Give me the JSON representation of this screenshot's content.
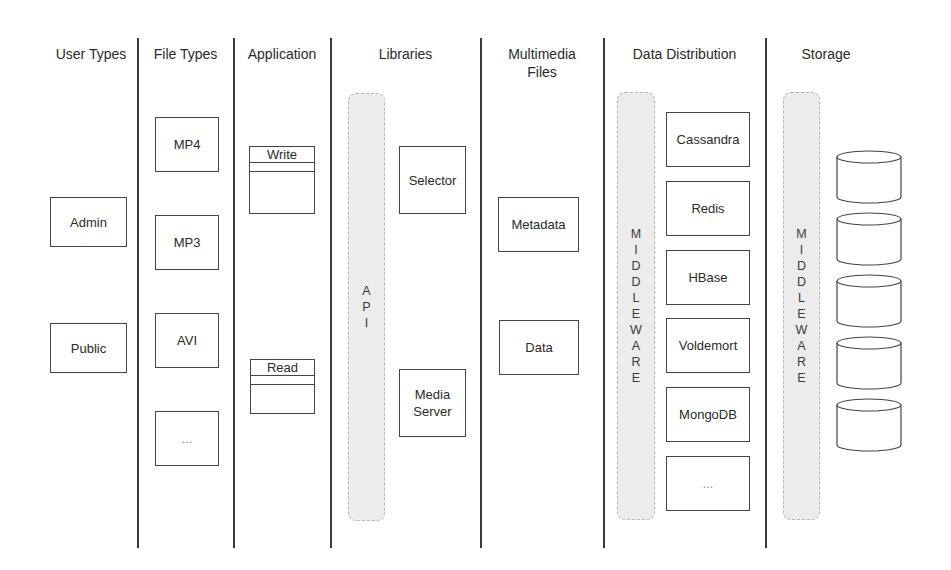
{
  "columns": [
    {
      "title": "User Types"
    },
    {
      "title": "File Types"
    },
    {
      "title": "Application"
    },
    {
      "title": "Libraries"
    },
    {
      "title": "Multimedia\nFiles",
      "title_line1": "Multimedia",
      "title_line2": "Files"
    },
    {
      "title": "Data Distribution"
    },
    {
      "title": "Storage"
    }
  ],
  "user_types": [
    "Admin",
    "Public"
  ],
  "file_types": [
    "MP4",
    "MP3",
    "AVI",
    "..."
  ],
  "application": [
    "Write",
    "Read"
  ],
  "libraries": {
    "api_bar": [
      "A",
      "P",
      "I"
    ],
    "components": [
      "Selector",
      "Media Server"
    ],
    "media_server_line1": "Media",
    "media_server_line2": "Server"
  },
  "multimedia_files": [
    "Metadata",
    "Data"
  ],
  "data_distribution": {
    "middleware_bar": [
      "M",
      "I",
      "D",
      "D",
      "L",
      "E",
      "W",
      "A",
      "R",
      "E"
    ],
    "databases": [
      "Cassandra",
      "Redis",
      "HBase",
      "Voldemort",
      "MongoDB",
      "..."
    ]
  },
  "storage": {
    "middleware_bar": [
      "M",
      "I",
      "D",
      "D",
      "L",
      "E",
      "W",
      "A",
      "R",
      "E"
    ],
    "disk_count": 5
  },
  "colors": {
    "line": "#3a3a3a",
    "bar_fill": "#ececec",
    "bar_border": "#b8b8b8",
    "text": "#2a2a2a"
  }
}
